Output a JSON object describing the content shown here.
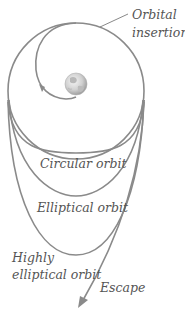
{
  "diagram": {
    "colors": {
      "orbit_stroke": "#8a8a8a",
      "label_text": "#555555",
      "earth_light": "#e8e8e8",
      "earth_dark": "#9a9a9a"
    },
    "labels": {
      "orbital_insertion_line1": "Orbital",
      "orbital_insertion_line2": "insertion",
      "circular_orbit": "Circular orbit",
      "elliptical_orbit": "Elliptical orbit",
      "highly_elliptical_line1": "Highly",
      "highly_elliptical_line2": "elliptical orbit",
      "escape": "Escape"
    },
    "icons": {
      "earth": "earth-globe-icon",
      "arrow": "arrowhead-icon"
    }
  }
}
